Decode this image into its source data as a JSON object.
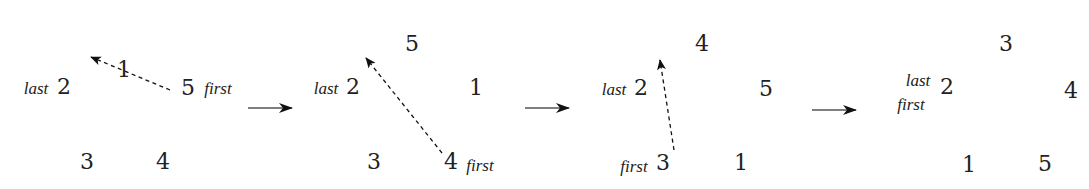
{
  "diagram": {
    "colors": {
      "text": "#222222",
      "arrow": "#111111",
      "background": "#ffffff"
    },
    "panels": [
      {
        "id": "state-1",
        "slots": [
          {
            "label": "1",
            "x": 124,
            "y": 70
          },
          {
            "label": "2",
            "x": 64,
            "y": 87
          },
          {
            "label": "3",
            "x": 87,
            "y": 162
          },
          {
            "label": "4",
            "x": 163,
            "y": 162
          },
          {
            "label": "5",
            "x": 188,
            "y": 88
          }
        ],
        "pointers": [
          {
            "label": "last",
            "x": 36,
            "y": 88
          },
          {
            "label": "first",
            "x": 218,
            "y": 88
          }
        ],
        "move_arrow": {
          "x1": 170,
          "y1": 90,
          "x2": 91,
          "y2": 57,
          "style": "dashed"
        }
      },
      {
        "id": "state-2",
        "slots": [
          {
            "label": "5",
            "x": 412,
            "y": 44
          },
          {
            "label": "2",
            "x": 353,
            "y": 87
          },
          {
            "label": "1",
            "x": 476,
            "y": 88
          },
          {
            "label": "3",
            "x": 374,
            "y": 162
          },
          {
            "label": "4",
            "x": 451,
            "y": 162
          }
        ],
        "pointers": [
          {
            "label": "last",
            "x": 326,
            "y": 88
          },
          {
            "label": "first",
            "x": 480,
            "y": 165
          }
        ],
        "move_arrow": {
          "x1": 442,
          "y1": 153,
          "x2": 366,
          "y2": 58,
          "style": "dashed"
        }
      },
      {
        "id": "state-3",
        "slots": [
          {
            "label": "4",
            "x": 702,
            "y": 44
          },
          {
            "label": "2",
            "x": 641,
            "y": 88
          },
          {
            "label": "5",
            "x": 766,
            "y": 89
          },
          {
            "label": "3",
            "x": 663,
            "y": 163
          },
          {
            "label": "1",
            "x": 741,
            "y": 163
          }
        ],
        "pointers": [
          {
            "label": "last",
            "x": 614,
            "y": 89
          },
          {
            "label": "first",
            "x": 634,
            "y": 166
          }
        ],
        "move_arrow": {
          "x1": 674,
          "y1": 150,
          "x2": 660,
          "y2": 60,
          "style": "dashed"
        }
      },
      {
        "id": "state-4",
        "slots": [
          {
            "label": "3",
            "x": 1006,
            "y": 44
          },
          {
            "label": "2",
            "x": 947,
            "y": 87
          },
          {
            "label": "4",
            "x": 1071,
            "y": 91
          },
          {
            "label": "1",
            "x": 969,
            "y": 165
          },
          {
            "label": "5",
            "x": 1045,
            "y": 164
          }
        ],
        "pointers": [
          {
            "label": "last",
            "x": 918,
            "y": 80
          },
          {
            "label": "first",
            "x": 911,
            "y": 104
          }
        ],
        "move_arrow": null
      }
    ],
    "transition_arrows": [
      {
        "x1": 248,
        "y1": 108,
        "x2": 292,
        "y2": 108
      },
      {
        "x1": 525,
        "y1": 108,
        "x2": 569,
        "y2": 108
      },
      {
        "x1": 812,
        "y1": 110,
        "x2": 856,
        "y2": 110
      }
    ]
  }
}
